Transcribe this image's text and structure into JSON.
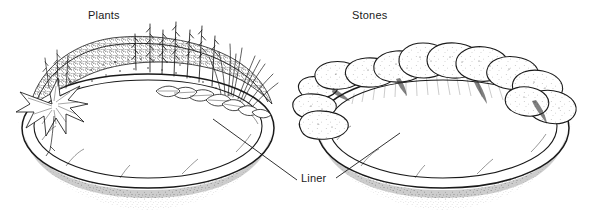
{
  "figure": {
    "background_color": "#ffffff",
    "ink_color": "#1a1a1a",
    "width": 589,
    "height": 220,
    "style": "black-and-white pen-and-ink line drawing"
  },
  "labels": {
    "plants": "Plants",
    "stones": "Stones",
    "liner": "Liner"
  },
  "panels": [
    {
      "id": "left",
      "label": "Plants",
      "edging": "dense planting of perennials, flower spikes, ornamental grasses and broad-leaved foliage around the rim",
      "pond": "oval excavated basin viewed in perspective with a flexible liner following the contour"
    },
    {
      "id": "right",
      "label": "Stones",
      "edging": "ring of irregular rounded flat stones laid around and overhanging the rim",
      "pond": "oval excavated basin viewed in perspective with a flexible liner following the contour"
    }
  ],
  "callout": {
    "text": "Liner",
    "targets": [
      "left-pond-liner",
      "right-pond-liner"
    ],
    "leader_count": 2
  }
}
